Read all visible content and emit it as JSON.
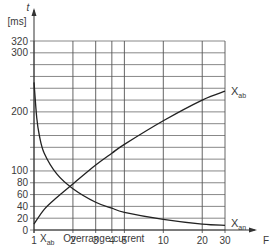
{
  "chart_data": {
    "type": "line",
    "title": "",
    "xlabel": "F",
    "ylabel": "t [ms]",
    "y_unit": "[ms]",
    "y_symbol": "t",
    "x_scale": "log",
    "xlim": [
      1,
      30
    ],
    "ylim": [
      0,
      320
    ],
    "grid": true,
    "x_ticks": [
      1,
      2,
      3,
      4,
      5,
      10,
      20,
      30
    ],
    "y_tick_labels": [
      0,
      20,
      40,
      60,
      80,
      100,
      200,
      300,
      320
    ],
    "y_gridlines": [
      0,
      20,
      40,
      60,
      80,
      100,
      120,
      140,
      160,
      180,
      200,
      220,
      240,
      260,
      280,
      300,
      320
    ],
    "series": [
      {
        "name": "X_ab",
        "label": "X",
        "label_sub": "ab",
        "x": [
          1,
          1.2,
          1.5,
          2,
          3,
          4,
          5,
          10,
          20,
          30
        ],
        "values": [
          10,
          35,
          55,
          78,
          110,
          130,
          145,
          185,
          220,
          235
        ]
      },
      {
        "name": "X_an",
        "label": "X",
        "label_sub": "an",
        "x": [
          1,
          1.05,
          1.1,
          1.2,
          1.5,
          2,
          3,
          4,
          5,
          10,
          20,
          30
        ],
        "values": [
          250,
          190,
          160,
          130,
          95,
          70,
          47,
          37,
          30,
          18,
          10,
          8
        ]
      }
    ],
    "legend": {
      "symbol": "X",
      "symbol_sub": "ab",
      "text": "Overrange current"
    }
  },
  "caption": {
    "symbol": "X",
    "symbol_sub": "ab",
    "text": "Overrange current"
  }
}
